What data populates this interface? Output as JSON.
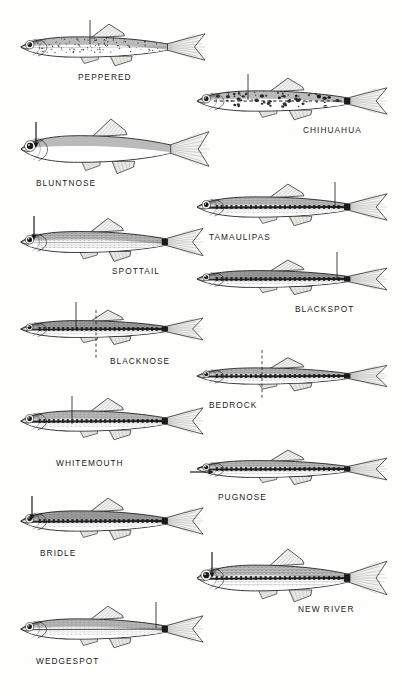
{
  "plate": {
    "kind": "field-guide-illustration-plate",
    "subject": "minnow and shiner species identification plate",
    "background_color": "#fefefd",
    "ink_color": "#1a1a1a",
    "label_case": "uppercase",
    "columns": 2,
    "layout": "staggered two-column, left column and right column alternating downward",
    "species_count": 14
  },
  "species": [
    {
      "label": "PEPPERED",
      "column": "left",
      "x": 14,
      "y": 18,
      "w": 192,
      "h": 58,
      "label_x": 78,
      "label_y": 72,
      "pointer": {
        "type": "line",
        "orientation": "vertical",
        "target": "dorsal-speckling",
        "x": 76,
        "y1": 2,
        "y2": 26
      },
      "pattern": "fine-speckles",
      "body_depth": "moderate",
      "caudal_spot": false,
      "lateral_stripe": "faint"
    },
    {
      "label": "CHIHUAHUA",
      "column": "right",
      "x": 190,
      "y": 72,
      "w": 198,
      "h": 58,
      "label_x": 303,
      "label_y": 125,
      "pointer": {
        "type": "line",
        "orientation": "vertical",
        "target": "side-blotches",
        "x": 58,
        "y1": 2,
        "y2": 28
      },
      "pattern": "bold-blotches",
      "body_depth": "moderate",
      "caudal_spot": true,
      "lateral_stripe": "broken"
    },
    {
      "label": "BLUNTNOSE",
      "column": "left",
      "x": 14,
      "y": 118,
      "w": 196,
      "h": 62,
      "label_x": 36,
      "label_y": 178,
      "pointer": {
        "type": "arrow",
        "orientation": "down",
        "target": "blunt-snout",
        "x": 22,
        "y1": 4,
        "y2": 30
      },
      "pattern": "plain",
      "body_depth": "deep",
      "caudal_spot": false,
      "lateral_stripe": "none"
    },
    {
      "label": "TAMAULIPAS",
      "column": "right",
      "x": 190,
      "y": 178,
      "w": 198,
      "h": 58,
      "label_x": 209,
      "label_y": 232,
      "pointer": {
        "type": "line",
        "orientation": "vertical",
        "target": "caudal-spot",
        "x": 145,
        "y1": 4,
        "y2": 28
      },
      "pattern": "scaled",
      "body_depth": "moderate",
      "caudal_spot": true,
      "lateral_stripe": "heavy"
    },
    {
      "label": "SPOTTAIL",
      "column": "left",
      "x": 14,
      "y": 212,
      "w": 190,
      "h": 60,
      "label_x": 112,
      "label_y": 266,
      "pointer": {
        "type": "arrow",
        "orientation": "down",
        "target": "snout",
        "x": 20,
        "y1": 4,
        "y2": 28
      },
      "pattern": "cross-hatch-scales",
      "body_depth": "moderate",
      "caudal_spot": true,
      "lateral_stripe": "faint"
    },
    {
      "label": "BLACKSPOT",
      "column": "right",
      "x": 190,
      "y": 250,
      "w": 198,
      "h": 58,
      "label_x": 295,
      "label_y": 304,
      "pointer": {
        "type": "line",
        "orientation": "vertical",
        "target": "caudal-spot",
        "x": 147,
        "y1": 2,
        "y2": 28
      },
      "pattern": "dark-dorsum",
      "body_depth": "slender",
      "caudal_spot": true,
      "lateral_stripe": "heavy"
    },
    {
      "label": "BLACKNOSE",
      "column": "left",
      "x": 14,
      "y": 300,
      "w": 190,
      "h": 58,
      "label_x": 110,
      "label_y": 356,
      "pointer": {
        "type": "line",
        "orientation": "vertical",
        "target": "dorsal-origin",
        "x": 62,
        "y1": 2,
        "y2": 30
      },
      "pointer2": {
        "type": "dashed",
        "orientation": "vertical",
        "target": "pelvic-fin-position",
        "x": 82,
        "y1": 10,
        "y2": 58
      },
      "pattern": "dark-stripe",
      "body_depth": "slender",
      "caudal_spot": true,
      "lateral_stripe": "heavy"
    },
    {
      "label": "BEDROCK",
      "column": "right",
      "x": 190,
      "y": 348,
      "w": 198,
      "h": 56,
      "label_x": 209,
      "label_y": 400,
      "pointer": {
        "type": "dashed",
        "orientation": "vertical",
        "target": "dorsal-fin-origin",
        "x": 72,
        "y1": 2,
        "y2": 52
      },
      "pattern": "scaled",
      "body_depth": "slender",
      "caudal_spot": true,
      "lateral_stripe": "heavy"
    },
    {
      "label": "WHITEMOUTH",
      "column": "left",
      "x": 14,
      "y": 392,
      "w": 190,
      "h": 58,
      "label_x": 56,
      "label_y": 458,
      "pointer": {
        "type": "line",
        "orientation": "vertical",
        "target": "mid-body",
        "x": 58,
        "y1": 4,
        "y2": 32
      },
      "pattern": "scaled",
      "body_depth": "moderate",
      "caudal_spot": true,
      "lateral_stripe": "heavy"
    },
    {
      "label": "PUGNOSE",
      "column": "right",
      "x": 190,
      "y": 440,
      "w": 198,
      "h": 58,
      "label_x": 218,
      "label_y": 492,
      "pointer": {
        "type": "arrow",
        "orientation": "right",
        "target": "upturned-mouth",
        "x1": 0,
        "x2": 24,
        "y": 32
      },
      "pattern": "scaled",
      "body_depth": "slender",
      "caudal_spot": true,
      "lateral_stripe": "heavy"
    },
    {
      "label": "BRIDLE",
      "column": "left",
      "x": 14,
      "y": 492,
      "w": 190,
      "h": 58,
      "label_x": 40,
      "label_y": 548,
      "pointer": {
        "type": "arrow",
        "orientation": "down",
        "target": "snout-stripe",
        "x": 18,
        "y1": 4,
        "y2": 28
      },
      "pattern": "dark-stripe",
      "body_depth": "moderate",
      "caudal_spot": true,
      "lateral_stripe": "heavy"
    },
    {
      "label": "NEW RIVER",
      "column": "right",
      "x": 190,
      "y": 548,
      "w": 198,
      "h": 60,
      "label_x": 298,
      "label_y": 604,
      "pointer": {
        "type": "arrow",
        "orientation": "down",
        "target": "nape",
        "x": 22,
        "y1": 4,
        "y2": 30
      },
      "pattern": "cross-hatch-scales",
      "body_depth": "deep",
      "caudal_spot": true,
      "lateral_stripe": "heavy"
    },
    {
      "label": "WEDGESPOT",
      "column": "left",
      "x": 14,
      "y": 600,
      "w": 190,
      "h": 58,
      "label_x": 36,
      "label_y": 656,
      "pointer": {
        "type": "line",
        "orientation": "vertical",
        "target": "caudal-wedge",
        "x": 142,
        "y1": 2,
        "y2": 28
      },
      "pattern": "scaled",
      "body_depth": "moderate",
      "caudal_spot": true,
      "lateral_stripe": "moderate"
    }
  ]
}
